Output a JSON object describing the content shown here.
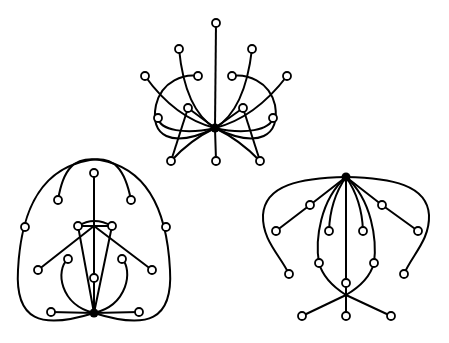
{
  "figure": {
    "colors": {
      "stroke": "#000000",
      "background": "#ffffff",
      "node_fill": "#ffffff",
      "hub_fill": "#000000"
    },
    "graphs": [
      {
        "name": "top-graph",
        "hub": [
          215,
          128
        ],
        "vertex_count": 15
      },
      {
        "name": "left-graph",
        "hub": [
          94,
          313
        ],
        "vertex_count": 15
      },
      {
        "name": "right-graph",
        "hub": [
          346,
          177
        ],
        "vertex_count": 15
      }
    ]
  }
}
